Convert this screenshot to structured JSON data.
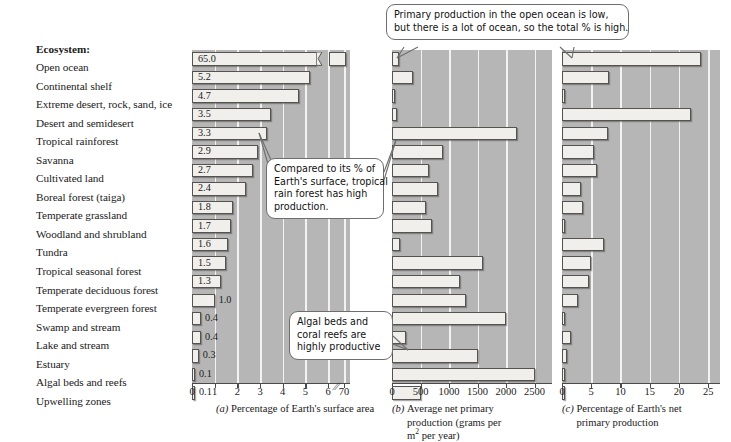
{
  "labels_header": "Ecosystem:",
  "ecosystems": [
    "Open ocean",
    "Continental shelf",
    "Extreme desert, rock, sand, ice",
    "Desert and semidesert",
    "Tropical rainforest",
    "Savanna",
    "Cultivated land",
    "Boreal forest (taiga)",
    "Temperate grassland",
    "Woodland and shrubland",
    "Tundra",
    "Tropical seasonal forest",
    "Temperate deciduous forest",
    "Temperate evergreen forest",
    "Swamp and stream",
    "Lake and stream",
    "Estuary",
    "Algal beds and reefs",
    "Upwelling zones"
  ],
  "callouts": [
    {
      "id": "open-ocean-callout",
      "lines": [
        "Primary production in the open ocean is low,",
        "but there is a lot of ocean, so the total % is high."
      ]
    },
    {
      "id": "tropical-rainforest-callout",
      "lines": [
        "Compared to its % of",
        "Earth's surface, tropical",
        "rain forest has high",
        "production."
      ]
    },
    {
      "id": "algal-beds-callout",
      "lines": [
        "Algal beds and",
        "coral reefs are",
        "highly productive"
      ]
    }
  ],
  "captions": [
    {
      "letter": "(a)",
      "text": "Percentage of Earth's surface area"
    },
    {
      "letter": "(b)",
      "text": "Average net primary production (grams per m2 per year)"
    },
    {
      "letter": "(c)",
      "text": "Percentage of Earth's net primary production"
    }
  ],
  "colors": {
    "plot_background": "#b6b6b6",
    "gridline": "#f2f2f2",
    "bar_fill": "#f0efec",
    "bar_stroke": "#55534f",
    "text": "#1a1a1a"
  },
  "chart_data": [
    {
      "type": "bar",
      "panel": "a",
      "title": "Percentage of Earth's surface area",
      "orientation": "horizontal",
      "xlabel": "Percentage of Earth's surface area",
      "ylabel": "Ecosystem",
      "xlim": [
        0,
        6
      ],
      "axis_broken": true,
      "broken_value_shown": 70,
      "ticks": [
        0,
        1,
        2,
        3,
        4,
        5,
        6,
        70
      ],
      "ticklabels": [
        "0",
        "1",
        "2",
        "3",
        "4",
        "5",
        "6",
        "70"
      ],
      "grid": true,
      "categories": [
        "Open ocean",
        "Continental shelf",
        "Extreme desert, rock, sand, ice",
        "Desert and semidesert",
        "Tropical rainforest",
        "Savanna",
        "Cultivated land",
        "Boreal forest (taiga)",
        "Temperate grassland",
        "Woodland and shrubland",
        "Tundra",
        "Tropical seasonal forest",
        "Temperate deciduous forest",
        "Temperate evergreen forest",
        "Swamp and stream",
        "Lake and stream",
        "Estuary",
        "Algal beds and reefs",
        "Upwelling zones"
      ],
      "values": [
        65.0,
        5.2,
        4.7,
        3.5,
        3.3,
        2.9,
        2.7,
        2.4,
        1.8,
        1.7,
        1.6,
        1.5,
        1.3,
        1.0,
        0.4,
        0.4,
        0.3,
        0.1,
        0.1
      ],
      "data_labels": [
        "65.0",
        "5.2",
        "4.7",
        "3.5",
        "3.3",
        "2.9",
        "2.7",
        "2.4",
        "1.8",
        "1.7",
        "1.6",
        "1.5",
        "1.3",
        "1.0",
        "0.4",
        "0.4",
        "0.3",
        "0.1",
        "0.1"
      ]
    },
    {
      "type": "bar",
      "panel": "b",
      "title": "Average net primary production (grams per m2 per year)",
      "orientation": "horizontal",
      "xlabel": "Average net primary production (grams per m2 per year)",
      "ylabel": "Ecosystem",
      "xlim": [
        0,
        2700
      ],
      "ticks": [
        0,
        500,
        1000,
        1500,
        2000,
        2500
      ],
      "ticklabels": [
        "0",
        "500",
        "1000",
        "1500",
        "2000",
        "2500"
      ],
      "grid": true,
      "categories": [
        "Open ocean",
        "Continental shelf",
        "Extreme desert, rock, sand, ice",
        "Desert and semidesert",
        "Tropical rainforest",
        "Savanna",
        "Cultivated land",
        "Boreal forest (taiga)",
        "Temperate grassland",
        "Woodland and shrubland",
        "Tundra",
        "Tropical seasonal forest",
        "Temperate deciduous forest",
        "Temperate evergreen forest",
        "Swamp and stream",
        "Lake and stream",
        "Estuary",
        "Algal beds and reefs",
        "Upwelling zones"
      ],
      "values": [
        125,
        360,
        3,
        90,
        2200,
        900,
        650,
        800,
        600,
        700,
        140,
        1600,
        1200,
        1300,
        2000,
        250,
        1500,
        2500,
        500
      ]
    },
    {
      "type": "bar",
      "panel": "c",
      "title": "Percentage of Earth's net primary production",
      "orientation": "horizontal",
      "xlabel": "Percentage of Earth's net primary production",
      "ylabel": "Ecosystem",
      "xlim": [
        0,
        26
      ],
      "ticks": [
        0,
        5,
        10,
        15,
        20,
        25
      ],
      "ticklabels": [
        "0",
        "5",
        "10",
        "15",
        "20",
        "25"
      ],
      "grid": true,
      "categories": [
        "Open ocean",
        "Continental shelf",
        "Extreme desert, rock, sand, ice",
        "Desert and semidesert",
        "Tropical rainforest",
        "Savanna",
        "Cultivated land",
        "Boreal forest (taiga)",
        "Temperate grassland",
        "Woodland and shrubland",
        "Tundra",
        "Tropical seasonal forest",
        "Temperate deciduous forest",
        "Temperate evergreen forest",
        "Swamp and stream",
        "Lake and stream",
        "Estuary",
        "Algal beds and reefs",
        "Upwelling zones"
      ],
      "values": [
        23.7,
        8.1,
        0.4,
        22.0,
        7.9,
        5.5,
        6.0,
        3.3,
        3.6,
        0.5,
        7.1,
        5.0,
        4.7,
        2.7,
        0.4,
        1.5,
        0.9,
        0.4,
        0.3
      ]
    }
  ],
  "panel_layout": [
    {
      "key": "a",
      "left": 192,
      "width": 158
    },
    {
      "key": "b",
      "left": 392,
      "width": 160
    },
    {
      "key": "c",
      "left": 562,
      "width": 158
    }
  ]
}
